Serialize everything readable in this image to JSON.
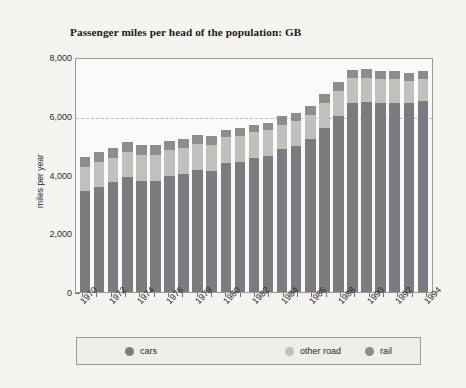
{
  "chart_data": {
    "type": "bar",
    "subtype": "stacked-bar",
    "title": "Passenger miles per head of the population: GB",
    "xlabel": "",
    "ylabel": "miles per year",
    "ylim": [
      0,
      8000
    ],
    "yticks": [
      0,
      2000,
      4000,
      6000,
      8000
    ],
    "ytick_labels": [
      "0",
      "2,000",
      "4,000",
      "6,000",
      "8,000"
    ],
    "grid": "dashed horizontal gridline at 6,000 only",
    "legend_position": "bottom",
    "categories": [
      "1970",
      "1971",
      "1972",
      "1973",
      "1974",
      "1975",
      "1976",
      "1977",
      "1978",
      "1979",
      "1980",
      "1981",
      "1982",
      "1983",
      "1984",
      "1985",
      "1986",
      "1987",
      "1988",
      "1989",
      "1990",
      "1991",
      "1992",
      "1993",
      "1994"
    ],
    "xtick_labels": [
      "1970",
      "1972",
      "1974",
      "1976",
      "1978",
      "1980",
      "1982",
      "1984",
      "1986",
      "1988",
      "1990",
      "1992",
      "1994"
    ],
    "series": [
      {
        "name": "cars",
        "color": "#7b7b80",
        "values": [
          3430,
          3570,
          3740,
          3920,
          3780,
          3770,
          3960,
          4010,
          4160,
          4130,
          4380,
          4430,
          4570,
          4620,
          4870,
          4980,
          5200,
          5580,
          6000,
          6450,
          6460,
          6440,
          6450,
          6430,
          6490
        ]
      },
      {
        "name": "other road",
        "color": "#c0c0bc",
        "values": [
          820,
          860,
          820,
          840,
          870,
          880,
          880,
          890,
          870,
          880,
          890,
          880,
          890,
          900,
          830,
          830,
          830,
          840,
          840,
          830,
          830,
          800,
          790,
          760,
          760
        ]
      },
      {
        "name": "rail",
        "color": "#8d8d8d",
        "values": [
          340,
          340,
          340,
          350,
          340,
          340,
          290,
          310,
          300,
          300,
          260,
          260,
          240,
          250,
          300,
          290,
          290,
          310,
          310,
          290,
          310,
          290,
          280,
          260,
          260
        ]
      }
    ],
    "totals": [
      4590,
      4770,
      4900,
      5110,
      4990,
      4990,
      5130,
      5210,
      5330,
      5310,
      5530,
      5570,
      5700,
      5770,
      6000,
      6100,
      6320,
      6730,
      7150,
      7570,
      7600,
      7530,
      7520,
      7450,
      7510
    ]
  },
  "legend": {
    "items": [
      {
        "label": "cars",
        "color": "#7b7b80"
      },
      {
        "label": "other road",
        "color": "#c0c0bc"
      },
      {
        "label": "rail",
        "color": "#8d8d8d"
      }
    ]
  },
  "colors": {
    "figure_background": "#f5f4f1",
    "plot_background": "#fbfaf8",
    "axis_line": "#9a9a96",
    "gridline": "#b9b9b4",
    "text": "#1f1f1f"
  }
}
